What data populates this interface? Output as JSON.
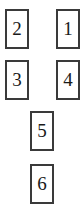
{
  "diagram": {
    "type": "numbered-box-layout",
    "background_color": "#ffffff",
    "border_color": "#3a3a3a",
    "text_color": "#1a1a1a",
    "canvas": {
      "width": 84,
      "height": 218
    },
    "box_size": {
      "width": 24,
      "height": 40
    },
    "nodes": [
      {
        "label": "2",
        "x": 5,
        "y": 9,
        "row": 1,
        "column": "left"
      },
      {
        "label": "1",
        "x": 56,
        "y": 9,
        "row": 1,
        "column": "right"
      },
      {
        "label": "3",
        "x": 5,
        "y": 60,
        "row": 2,
        "column": "left"
      },
      {
        "label": "4",
        "x": 56,
        "y": 60,
        "row": 2,
        "column": "right"
      },
      {
        "label": "5",
        "x": 30,
        "y": 111,
        "row": 3,
        "column": "center"
      },
      {
        "label": "6",
        "x": 30,
        "y": 164,
        "row": 4,
        "column": "center"
      }
    ]
  }
}
